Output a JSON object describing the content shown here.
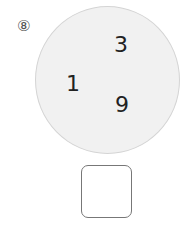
{
  "problem": {
    "number_label": "⑧",
    "numbers": [
      "3",
      "1",
      "9"
    ],
    "answer": ""
  }
}
